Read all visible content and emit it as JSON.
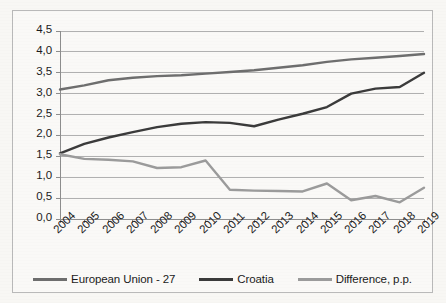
{
  "chart_data": {
    "type": "line",
    "title": "",
    "subtitle": "",
    "xlabel": "",
    "ylabel": "",
    "categories": [
      "2004",
      "2005",
      "2006",
      "2007",
      "2008",
      "2009",
      "2010",
      "2011",
      "2012",
      "2013",
      "2014",
      "2015",
      "2016",
      "2017",
      "2018",
      "2019"
    ],
    "ylim": [
      0.0,
      4.5
    ],
    "ytick_labels": [
      "0,0",
      "0,5",
      "1,0",
      "1,5",
      "2,0",
      "2,5",
      "3,0",
      "3,5",
      "4,0",
      "4,5"
    ],
    "ytick_values": [
      0.0,
      0.5,
      1.0,
      1.5,
      2.0,
      2.5,
      3.0,
      3.5,
      4.0,
      4.5
    ],
    "grid": true,
    "legend_position": "bottom",
    "decimal_separator": ",",
    "series": [
      {
        "name": "European Union - 27",
        "color": "#6e6e6e",
        "values": [
          3.1,
          3.2,
          3.32,
          3.38,
          3.42,
          3.44,
          3.48,
          3.52,
          3.56,
          3.62,
          3.68,
          3.76,
          3.82,
          3.86,
          3.9,
          3.95
        ]
      },
      {
        "name": "Croatia",
        "color": "#3b3b3b",
        "values": [
          1.57,
          1.8,
          1.95,
          2.08,
          2.2,
          2.28,
          2.32,
          2.3,
          2.22,
          2.38,
          2.52,
          2.68,
          3.0,
          3.12,
          3.16,
          3.5
        ]
      },
      {
        "name": "Difference, p.p.",
        "color": "#9b9b9b",
        "values": [
          1.55,
          1.44,
          1.42,
          1.38,
          1.22,
          1.24,
          1.4,
          0.7,
          0.68,
          0.67,
          0.66,
          0.85,
          0.45,
          0.55,
          0.4,
          0.75
        ]
      }
    ]
  },
  "legend": {
    "items": [
      {
        "label": "European Union - 27",
        "color": "#6e6e6e"
      },
      {
        "label": "Croatia",
        "color": "#3b3b3b"
      },
      {
        "label": "Difference, p.p.",
        "color": "#9b9b9b"
      }
    ]
  },
  "colors": {
    "eu": "#6e6e6e",
    "croatia": "#3b3b3b",
    "difference": "#9b9b9b",
    "grid": "#b0b0b0",
    "frame": "#b9b9b9",
    "text": "#1b1b1b"
  }
}
